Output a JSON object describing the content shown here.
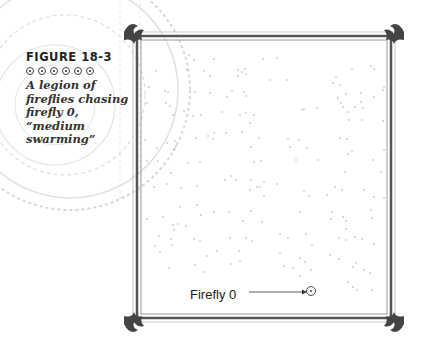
{
  "caption": {
    "figure_label": "FIGURE 18-3",
    "ornament_count": 6,
    "text_lines": [
      "A legion of",
      "fireflies chasing",
      "firefly 0,",
      "“medium",
      "swarming”"
    ]
  },
  "figure": {
    "callout_label": "Firefly 0",
    "target": {
      "x": 310,
      "y": 291
    },
    "frame": {
      "left": 137,
      "top": 36,
      "right": 391,
      "bottom": 318
    },
    "colors": {
      "frame": "#555555",
      "dots": "#9a9a9a",
      "text": "#222222"
    },
    "fireflies": [
      [
        189,
        55
      ],
      [
        194,
        60
      ],
      [
        214,
        59
      ],
      [
        156,
        71
      ],
      [
        187,
        70
      ],
      [
        204,
        71
      ],
      [
        210,
        76
      ],
      [
        238,
        70
      ],
      [
        242,
        72
      ],
      [
        246,
        74
      ],
      [
        245,
        69
      ],
      [
        238,
        76
      ],
      [
        149,
        87
      ],
      [
        165,
        91
      ],
      [
        168,
        92
      ],
      [
        195,
        92
      ],
      [
        210,
        93
      ],
      [
        227,
        97
      ],
      [
        232,
        91
      ],
      [
        244,
        92
      ],
      [
        246,
        96
      ],
      [
        147,
        103
      ],
      [
        166,
        103
      ],
      [
        170,
        106
      ],
      [
        184,
        111
      ],
      [
        193,
        116
      ],
      [
        173,
        115
      ],
      [
        201,
        115
      ],
      [
        222,
        112
      ],
      [
        240,
        115
      ],
      [
        246,
        113
      ],
      [
        254,
        115
      ],
      [
        250,
        123
      ],
      [
        263,
        59
      ],
      [
        277,
        58
      ],
      [
        270,
        80
      ],
      [
        287,
        80
      ],
      [
        333,
        83
      ],
      [
        336,
        77
      ],
      [
        340,
        85
      ],
      [
        352,
        69
      ],
      [
        371,
        66
      ],
      [
        374,
        69
      ],
      [
        383,
        90
      ],
      [
        384,
        87
      ],
      [
        361,
        93
      ],
      [
        346,
        94
      ],
      [
        374,
        97
      ],
      [
        361,
        102
      ],
      [
        338,
        98
      ],
      [
        341,
        103
      ],
      [
        348,
        112
      ],
      [
        363,
        108
      ],
      [
        302,
        110
      ],
      [
        304,
        109
      ],
      [
        343,
        107
      ],
      [
        355,
        107
      ],
      [
        317,
        108
      ],
      [
        349,
        120
      ],
      [
        383,
        121
      ],
      [
        362,
        120
      ],
      [
        145,
        140
      ],
      [
        157,
        148
      ],
      [
        167,
        143
      ],
      [
        176,
        146
      ],
      [
        175,
        141
      ],
      [
        196,
        138
      ],
      [
        208,
        136
      ],
      [
        213,
        139
      ],
      [
        214,
        133
      ],
      [
        226,
        133
      ],
      [
        242,
        132
      ],
      [
        251,
        147
      ],
      [
        147,
        161
      ],
      [
        158,
        161
      ],
      [
        174,
        150
      ],
      [
        188,
        163
      ],
      [
        171,
        173
      ],
      [
        200,
        162
      ],
      [
        254,
        162
      ],
      [
        261,
        161
      ],
      [
        259,
        138
      ],
      [
        288,
        139
      ],
      [
        299,
        140
      ],
      [
        290,
        147
      ],
      [
        307,
        148
      ],
      [
        296,
        160
      ],
      [
        318,
        160
      ],
      [
        340,
        138
      ],
      [
        347,
        139
      ],
      [
        348,
        154
      ],
      [
        352,
        151
      ],
      [
        373,
        160
      ],
      [
        384,
        150
      ],
      [
        381,
        172
      ],
      [
        154,
        187
      ],
      [
        167,
        184
      ],
      [
        181,
        188
      ],
      [
        197,
        186
      ],
      [
        225,
        180
      ],
      [
        231,
        176
      ],
      [
        236,
        180
      ],
      [
        250,
        190
      ],
      [
        257,
        187
      ],
      [
        251,
        180
      ],
      [
        264,
        182
      ],
      [
        260,
        187
      ],
      [
        264,
        196
      ],
      [
        277,
        184
      ],
      [
        345,
        172
      ],
      [
        335,
        187
      ],
      [
        342,
        190
      ],
      [
        327,
        195
      ],
      [
        304,
        191
      ],
      [
        309,
        196
      ],
      [
        364,
        190
      ],
      [
        374,
        197
      ],
      [
        384,
        198
      ],
      [
        197,
        205
      ],
      [
        180,
        207
      ],
      [
        214,
        212
      ],
      [
        229,
        212
      ],
      [
        251,
        211
      ],
      [
        243,
        221
      ],
      [
        262,
        222
      ],
      [
        300,
        212
      ],
      [
        332,
        212
      ],
      [
        331,
        219
      ],
      [
        343,
        217
      ],
      [
        346,
        221
      ],
      [
        346,
        229
      ],
      [
        371,
        210
      ],
      [
        147,
        219
      ],
      [
        163,
        217
      ],
      [
        173,
        225
      ],
      [
        186,
        226
      ],
      [
        201,
        215
      ],
      [
        178,
        224
      ],
      [
        174,
        230
      ],
      [
        159,
        236
      ],
      [
        171,
        239
      ],
      [
        194,
        239
      ],
      [
        200,
        241
      ],
      [
        230,
        238
      ],
      [
        252,
        241
      ],
      [
        246,
        238
      ],
      [
        280,
        234
      ],
      [
        288,
        238
      ],
      [
        306,
        234
      ],
      [
        312,
        245
      ],
      [
        339,
        238
      ],
      [
        346,
        240
      ],
      [
        355,
        237
      ],
      [
        362,
        239
      ],
      [
        374,
        244
      ],
      [
        372,
        218
      ],
      [
        155,
        246
      ],
      [
        160,
        252
      ],
      [
        172,
        245
      ],
      [
        217,
        251
      ],
      [
        207,
        256
      ],
      [
        239,
        251
      ],
      [
        280,
        253
      ],
      [
        300,
        258
      ],
      [
        305,
        262
      ],
      [
        330,
        255
      ],
      [
        353,
        267
      ],
      [
        356,
        263
      ],
      [
        339,
        259
      ],
      [
        169,
        268
      ],
      [
        195,
        265
      ],
      [
        204,
        272
      ],
      [
        231,
        264
      ],
      [
        284,
        266
      ],
      [
        293,
        268
      ],
      [
        311,
        270
      ],
      [
        364,
        270
      ],
      [
        370,
        273
      ],
      [
        348,
        282
      ],
      [
        353,
        287
      ],
      [
        357,
        290
      ],
      [
        372,
        290
      ],
      [
        300,
        276
      ],
      [
        240,
        261
      ]
    ]
  }
}
